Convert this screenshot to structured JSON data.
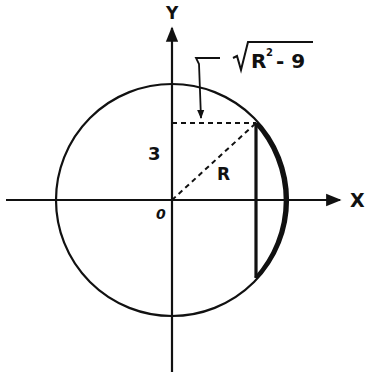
{
  "diagram": {
    "type": "geometry",
    "labels": {
      "y_axis": "Y",
      "x_axis": "X",
      "origin": "0",
      "height": "3",
      "radius": "R",
      "half_chord": "√R² − 9",
      "half_chord_parts": {
        "radical": "√",
        "base": "R",
        "exponent": "2",
        "rest": "- 9"
      }
    },
    "colors": {
      "ink": "#111111",
      "background": "#ffffff"
    },
    "geometry": {
      "center": [
        172,
        200
      ],
      "radius_px": 116,
      "chord_x": 256,
      "chord_top_y": 123,
      "chord_bottom_y": 278
    }
  }
}
